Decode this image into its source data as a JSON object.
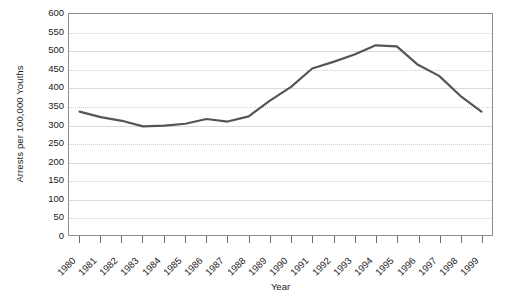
{
  "chart_data": {
    "type": "line",
    "title": "",
    "xlabel": "Year",
    "ylabel": "Arrests per 100,000 Youths",
    "categories": [
      "1980",
      "1981",
      "1982",
      "1983",
      "1984",
      "1985",
      "1986",
      "1987",
      "1988",
      "1989",
      "1990",
      "1991",
      "1992",
      "1993",
      "1994",
      "1995",
      "1996",
      "1997",
      "1998",
      "1999"
    ],
    "values": [
      335,
      320,
      310,
      295,
      297,
      302,
      315,
      308,
      322,
      365,
      402,
      452,
      470,
      490,
      515,
      512,
      462,
      432,
      378,
      335
    ],
    "series": [
      {
        "name": "Arrests per 100,000 Youths",
        "values": [
          335,
          320,
          310,
          295,
          297,
          302,
          315,
          308,
          322,
          365,
          402,
          452,
          470,
          490,
          515,
          512,
          462,
          432,
          378,
          335
        ]
      }
    ],
    "ylim": [
      0,
      600
    ],
    "y_ticks": [
      0,
      50,
      100,
      150,
      200,
      250,
      300,
      350,
      400,
      450,
      500,
      550,
      600
    ],
    "y_tick_labels": [
      "0",
      "50",
      "100",
      "150",
      "200",
      "250",
      "300",
      "350",
      "400",
      "450",
      "500",
      "550",
      "600"
    ],
    "x_tick_labels": [
      "1980",
      "1981",
      "1982",
      "1983",
      "1984",
      "1985",
      "1986",
      "1987",
      "1988",
      "1989",
      "1990",
      "1991",
      "1992",
      "1993",
      "1994",
      "1995",
      "1996",
      "1997",
      "1998",
      "1999"
    ],
    "grid": true,
    "legend": false,
    "legend_position": "none",
    "line_color": "#555555",
    "grid_color": "#d9d9d9",
    "axis_color": "#8d8d8d",
    "background_color": "#ffffff"
  }
}
